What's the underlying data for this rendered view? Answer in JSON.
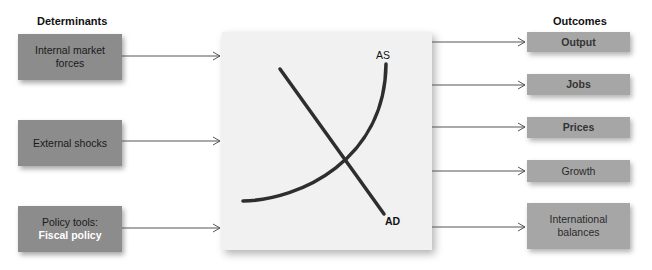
{
  "determinants": {
    "heading": "Determinants",
    "items": [
      {
        "line1": "Internal market",
        "line2": "forces"
      },
      {
        "line1": "External shocks",
        "line2": ""
      },
      {
        "line1": "Policy tools:",
        "line2": "Fiscal policy"
      }
    ]
  },
  "outcomes": {
    "heading": "Outcomes",
    "items": [
      {
        "line1": "Output",
        "line2": ""
      },
      {
        "line1": "Jobs",
        "line2": ""
      },
      {
        "line1": "Prices",
        "line2": ""
      },
      {
        "line1": "Growth",
        "line2": ""
      },
      {
        "line1": "International",
        "line2": "balances"
      }
    ]
  },
  "graph": {
    "as_label": "AS",
    "ad_label": "AD"
  },
  "colors": {
    "left_box": "#8c8c8c",
    "right_box": "#a6a6a6",
    "panel": "#f1f1f1",
    "curve": "#333333",
    "highlight_text": "#ffffff"
  }
}
